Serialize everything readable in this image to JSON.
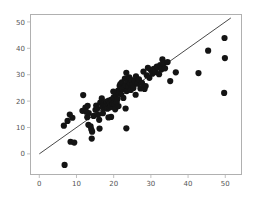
{
  "chart_data": {
    "type": "scatter",
    "title": "",
    "xlabel": "",
    "ylabel": "",
    "xlim": [
      -2.5,
      54.5
    ],
    "ylim": [
      -8.0,
      53.0
    ],
    "xticks": [
      0,
      10,
      20,
      30,
      40,
      50
    ],
    "yticks": [
      0,
      10,
      20,
      30,
      40,
      50
    ],
    "xtick_labels": [
      "0",
      "10",
      "20",
      "30",
      "40",
      "50"
    ],
    "ytick_labels": [
      "0",
      "10",
      "20",
      "30",
      "40",
      "50"
    ],
    "grid": false,
    "legend": null,
    "marker": "circle",
    "marker_color": "#141414",
    "marker_size": 4.2,
    "reference_line": {
      "type": "identity",
      "label": "y = x",
      "color": "#1a1a1a",
      "x_start": 0,
      "y_start": 0,
      "x_end": 51.5,
      "y_end": 51.5
    },
    "points": [
      [
        6.8,
        -4.2
      ],
      [
        6.6,
        10.7
      ],
      [
        7.6,
        12.5
      ],
      [
        8.2,
        14.9
      ],
      [
        8.9,
        13.7
      ],
      [
        8.4,
        4.6
      ],
      [
        9.4,
        4.3
      ],
      [
        11.8,
        22.3
      ],
      [
        11.6,
        16.3
      ],
      [
        12.4,
        17.5
      ],
      [
        12.9,
        13.9
      ],
      [
        13.3,
        15.5
      ],
      [
        13.2,
        11.0
      ],
      [
        13.8,
        10.4
      ],
      [
        14.0,
        9.2
      ],
      [
        14.2,
        8.4
      ],
      [
        14.1,
        5.8
      ],
      [
        15.1,
        16.7
      ],
      [
        15.3,
        18.3
      ],
      [
        15.8,
        14.8
      ],
      [
        16.1,
        12.9
      ],
      [
        16.4,
        19.4
      ],
      [
        16.8,
        21.0
      ],
      [
        17.0,
        18.0
      ],
      [
        17.2,
        17.3
      ],
      [
        17.4,
        19.1
      ],
      [
        17.6,
        18.6
      ],
      [
        17.8,
        17.8
      ],
      [
        18.0,
        18.4
      ],
      [
        18.1,
        19.8
      ],
      [
        18.3,
        17.1
      ],
      [
        18.5,
        18.9
      ],
      [
        18.7,
        20.2
      ],
      [
        18.9,
        17.6
      ],
      [
        19.0,
        19.3
      ],
      [
        19.2,
        18.2
      ],
      [
        19.4,
        20.6
      ],
      [
        19.6,
        17.9
      ],
      [
        19.8,
        19.0
      ],
      [
        20.0,
        21.4
      ],
      [
        20.2,
        18.7
      ],
      [
        20.4,
        16.9
      ],
      [
        20.6,
        22.1
      ],
      [
        20.8,
        19.6
      ],
      [
        21.0,
        20.8
      ],
      [
        21.2,
        24.0
      ],
      [
        21.4,
        23.2
      ],
      [
        21.6,
        25.8
      ],
      [
        21.8,
        26.4
      ],
      [
        22.0,
        22.6
      ],
      [
        22.2,
        27.1
      ],
      [
        22.4,
        24.6
      ],
      [
        22.6,
        21.2
      ],
      [
        22.8,
        25.2
      ],
      [
        23.0,
        28.5
      ],
      [
        23.2,
        26.0
      ],
      [
        23.4,
        30.7
      ],
      [
        23.5,
        23.8
      ],
      [
        23.8,
        27.5
      ],
      [
        24.0,
        25.5
      ],
      [
        24.2,
        29.0
      ],
      [
        24.4,
        26.8
      ],
      [
        24.6,
        24.2
      ],
      [
        24.8,
        28.0
      ],
      [
        25.0,
        26.2
      ],
      [
        25.3,
        25.0
      ],
      [
        25.6,
        27.8
      ],
      [
        26.0,
        29.4
      ],
      [
        26.4,
        26.6
      ],
      [
        26.8,
        28.2
      ],
      [
        27.2,
        24.8
      ],
      [
        27.6,
        26.9
      ],
      [
        28.0,
        31.2
      ],
      [
        28.3,
        24.6
      ],
      [
        28.6,
        25.7
      ],
      [
        28.9,
        29.8
      ],
      [
        29.2,
        32.6
      ],
      [
        29.6,
        28.8
      ],
      [
        30.0,
        31.8
      ],
      [
        30.4,
        30.4
      ],
      [
        30.8,
        32.2
      ],
      [
        31.2,
        31.0
      ],
      [
        31.6,
        33.1
      ],
      [
        31.9,
        32.8
      ],
      [
        32.2,
        30.2
      ],
      [
        32.5,
        33.6
      ],
      [
        32.8,
        32.0
      ],
      [
        33.1,
        35.8
      ],
      [
        33.4,
        34.2
      ],
      [
        33.8,
        32.4
      ],
      [
        34.5,
        34.8
      ],
      [
        23.2,
        17.2
      ],
      [
        23.4,
        9.7
      ],
      [
        19.3,
        14.0
      ],
      [
        18.6,
        13.8
      ],
      [
        16.2,
        9.6
      ],
      [
        14.6,
        14.4
      ],
      [
        13.0,
        18.2
      ],
      [
        12.6,
        16.0
      ],
      [
        36.7,
        30.9
      ],
      [
        35.2,
        27.6
      ],
      [
        42.8,
        30.6
      ],
      [
        45.4,
        39.1
      ],
      [
        49.8,
        43.9
      ],
      [
        49.9,
        36.3
      ],
      [
        49.7,
        23.1
      ],
      [
        19.9,
        23.6
      ],
      [
        21.3,
        18.1
      ],
      [
        15.6,
        17.2
      ],
      [
        17.1,
        15.4
      ],
      [
        25.9,
        22.4
      ]
    ]
  },
  "axes": {
    "x_axis_name": "x-axis",
    "y_axis_name": "y-axis"
  }
}
